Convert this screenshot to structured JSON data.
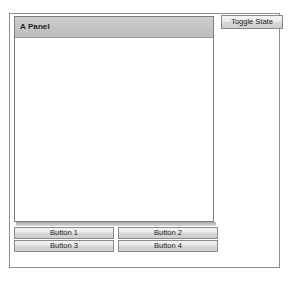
{
  "window": {
    "background_color": "#ffffff",
    "border_color": "#8e8e8e"
  },
  "panel": {
    "title": "A Panel",
    "header_color": "#c4c4c4",
    "body_color": "#ffffff",
    "border_color": "#7d7d7d"
  },
  "toolbar": {
    "toggle_state_label": "Toggle State"
  },
  "buttons": [
    {
      "label": "Button 1"
    },
    {
      "label": "Button 2"
    },
    {
      "label": "Button 3"
    },
    {
      "label": "Button 4"
    }
  ],
  "theme": {
    "button_face": "#e9e9e9",
    "button_border": "#8a8a8a",
    "text_color": "#1a1a1a"
  }
}
